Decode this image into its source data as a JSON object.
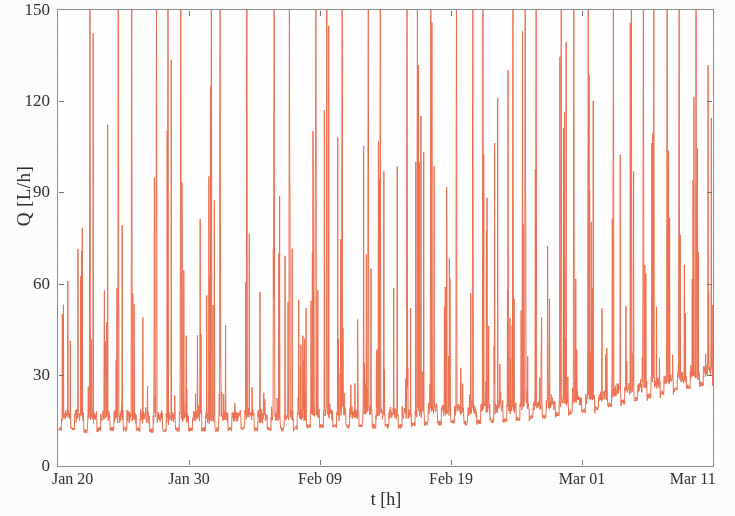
{
  "chart_data": {
    "type": "line",
    "title": "",
    "subtitle": "",
    "xlabel": "t [h]",
    "ylabel": "Q [L/h]",
    "series_name": "Q",
    "line_color": "#ED7050",
    "line_width": 1,
    "grid": false,
    "legend": "none",
    "ylim": [
      0,
      150
    ],
    "yticks": [
      0,
      30,
      60,
      90,
      120,
      150
    ],
    "ytick_labels": [
      "0",
      "30",
      "60",
      "90",
      "120",
      "150"
    ],
    "xlim_labels": [
      "Jan 20",
      "Mar 11"
    ],
    "xticks": [
      "Jan 20",
      "Jan 30",
      "Feb 09",
      "Feb 19",
      "Mar 01",
      "Mar 11"
    ],
    "xtick_positions_days": [
      0,
      10,
      20,
      30,
      40,
      50
    ],
    "x_unit": "days from Jan 20",
    "sampling": "sub-hourly water demand trace, 51 days",
    "baseline_profile": [
      12,
      12,
      11.5,
      12,
      12,
      12,
      12,
      11.5,
      11.5,
      12,
      12,
      12,
      12,
      12,
      12.5,
      12,
      12,
      12,
      12.5,
      13,
      13,
      13,
      13,
      13.5,
      13,
      13,
      13,
      13.5,
      14,
      14,
      14.5,
      14,
      14.5,
      15,
      15,
      15.5,
      16,
      16,
      17,
      17.5,
      18,
      19,
      20,
      21,
      22,
      23,
      24,
      25,
      26,
      27,
      28
    ],
    "daily_peak_max": [
      139,
      122,
      150,
      113,
      150,
      150,
      95,
      150,
      150,
      150,
      105,
      150,
      150,
      96,
      150,
      119,
      150,
      150,
      93,
      150,
      150,
      150,
      105,
      150,
      150,
      114,
      150,
      150,
      150,
      110,
      150,
      150,
      150,
      123,
      150,
      150,
      150,
      118,
      150,
      150,
      150,
      107,
      150,
      150,
      150,
      150,
      150,
      150,
      150,
      146,
      140
    ],
    "peaks_clipped_at_top": 40,
    "samples_per_day": 48,
    "note_axis_frame": "full rectangular box, ticks inward on all four sides"
  },
  "axes": {
    "yticks": [
      {
        "value": 150,
        "label": "150"
      },
      {
        "value": 120,
        "label": "120"
      },
      {
        "value": 90,
        "label": "90"
      },
      {
        "value": 60,
        "label": "60"
      },
      {
        "value": 30,
        "label": "30"
      },
      {
        "value": 0,
        "label": "0"
      }
    ],
    "xticks": [
      {
        "day": 0,
        "label": "Jan 20"
      },
      {
        "day": 10,
        "label": "Jan 30"
      },
      {
        "day": 20,
        "label": "Feb 09"
      },
      {
        "day": 30,
        "label": "Feb 19"
      },
      {
        "day": 40,
        "label": "Mar 01"
      },
      {
        "day": 50,
        "label": "Mar 11"
      }
    ],
    "xlabel": "t [h]",
    "ylabel": "Q [L/h]"
  }
}
